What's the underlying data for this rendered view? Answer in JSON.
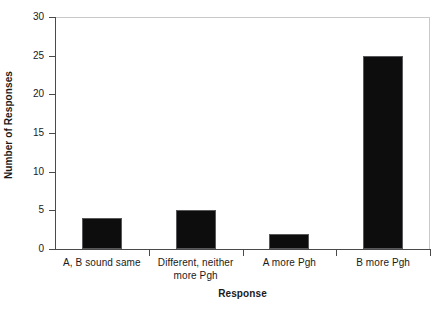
{
  "chart_data": {
    "type": "bar",
    "title": "",
    "xlabel": "Response",
    "ylabel": "Number of Responses",
    "categories": [
      "A, B sound same",
      "Different, neither more Pgh",
      "A more Pgh",
      "B more Pgh"
    ],
    "category_lines": [
      [
        "A, B sound same"
      ],
      [
        "Different, neither",
        "more Pgh"
      ],
      [
        "A more Pgh"
      ],
      [
        "B more Pgh"
      ]
    ],
    "values": [
      4,
      5,
      2,
      25
    ],
    "ylim": [
      0,
      30
    ],
    "ytick_values": [
      0,
      5,
      10,
      15,
      20,
      25,
      30
    ],
    "ytick_labels": [
      "0",
      "5",
      "10",
      "15",
      "20",
      "25",
      "30"
    ],
    "grid": false,
    "legend": null,
    "bar_color": "#0d0d0d",
    "bar_edge_color": "#59595c",
    "axis_color": "#4a4a4a",
    "frame_color": "#c9c9c9",
    "background_color": "#ffffff"
  }
}
